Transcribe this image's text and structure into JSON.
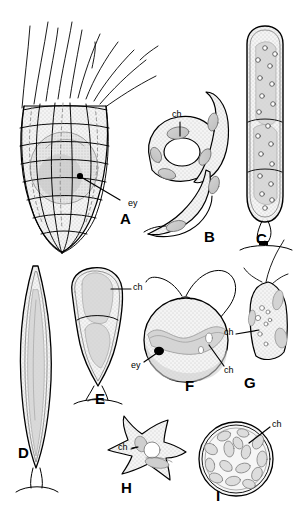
{
  "figure": {
    "kind": "scientific-plate",
    "background_color": "#ffffff",
    "ink_color": "#000000",
    "shade_fill": "#dcdcdc",
    "stipple_color": "#9a9a9a",
    "width": 302,
    "height": 517
  },
  "panels": [
    {
      "id": "A",
      "letter": "A",
      "letter_x": 120,
      "letter_y": 218,
      "description": "vase-shaped lorica cell with grid reticulation, flagella tuft and eyespot",
      "annotations": [
        {
          "text": "ey",
          "x": 128,
          "y": 203
        }
      ]
    },
    {
      "id": "B",
      "letter": "B",
      "letter_x": 204,
      "letter_y": 236,
      "description": "helical spiral cell bearing lens-shaped chloroplasts",
      "annotations": [
        {
          "text": "ch",
          "x": 172,
          "y": 116
        }
      ]
    },
    {
      "id": "C",
      "letter": "C",
      "letter_x": 256,
      "letter_y": 238,
      "description": "elongate cylindrical cell with vesicles and basal stalk",
      "annotations": []
    },
    {
      "id": "D",
      "letter": "D",
      "letter_x": 18,
      "letter_y": 452,
      "description": "slender spindle-shaped cell with long axial chloroplast",
      "annotations": []
    },
    {
      "id": "E",
      "letter": "E",
      "letter_x": 95,
      "letter_y": 398,
      "description": "club-shaped two-lobed cell on short stalk",
      "annotations": [
        {
          "text": "ch",
          "x": 133,
          "y": 288
        }
      ]
    },
    {
      "id": "F",
      "letter": "F",
      "letter_x": 185,
      "letter_y": 385,
      "description": "rounded biflagellate cell with band chloroplast and eyespot",
      "annotations": [
        {
          "text": "ey",
          "x": 134,
          "y": 365
        },
        {
          "text": "ch",
          "x": 226,
          "y": 370
        }
      ]
    },
    {
      "id": "G",
      "letter": "G",
      "letter_x": 244,
      "letter_y": 382,
      "description": "small angular flagellate cell with granules",
      "annotations": [
        {
          "text": "ch",
          "x": 236,
          "y": 332
        }
      ]
    },
    {
      "id": "H",
      "letter": "H",
      "letter_x": 121,
      "letter_y": 487,
      "description": "amoeboid stellate cell with radiating pseudopodia",
      "annotations": [
        {
          "text": "ch",
          "x": 124,
          "y": 448
        }
      ]
    },
    {
      "id": "I",
      "letter": "I",
      "letter_x": 216,
      "letter_y": 495,
      "description": "spherical cell packed with numerous discoid chloroplasts",
      "annotations": [
        {
          "text": "ch",
          "x": 274,
          "y": 424
        }
      ]
    }
  ],
  "legend_terms": {
    "ch": "chloroplast",
    "ey": "eyespot"
  }
}
